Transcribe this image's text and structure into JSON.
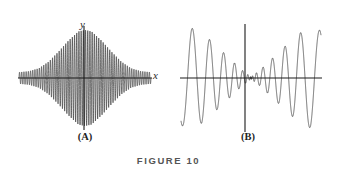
{
  "figure": {
    "caption": "FIGURE 10",
    "background_color": "#ffffff",
    "stroke_color": "#3a3a3a",
    "axis_color": "#1a1a1a"
  },
  "panels": [
    {
      "id": "A",
      "label": "(A)",
      "x_axis_label": "x",
      "y_axis_label": "y",
      "description": "amplitude-modulated oscillation with lens shaped envelope, maximum amplitude at the origin"
    },
    {
      "id": "B",
      "label": "(B)",
      "x_axis_label": "x",
      "y_axis_label": "y",
      "description": "oscillation pinched to near-zero amplitude at the origin and growing outward, bowtie shaped envelope near center"
    }
  ],
  "chart_data": [
    {
      "type": "line",
      "title": "(A)",
      "xlabel": "x",
      "ylabel": "y",
      "xlim": [
        -1,
        1
      ],
      "ylim": [
        -1.05,
        1.05
      ],
      "grid": false,
      "legend": null,
      "axes": {
        "x_axis_at_y": 0,
        "y_axis_at_x": 0,
        "arrows": false
      },
      "series": [
        {
          "name": "amplitude-modulated wave",
          "formula": "y = A(x) * sin(k(x) * x)",
          "envelope_description": "lens / diamond shaped, peak amplitude 1.0 at x = 0, decaying to about 0.12 at the plot edges",
          "envelope_x": [
            -1.0,
            -0.85,
            -0.7,
            -0.55,
            -0.4,
            -0.25,
            -0.1,
            0.0,
            0.1,
            0.25,
            0.4,
            0.55,
            0.7,
            0.85,
            1.0
          ],
          "envelope_y": [
            0.12,
            0.14,
            0.2,
            0.34,
            0.55,
            0.78,
            0.97,
            1.0,
            0.97,
            0.78,
            0.55,
            0.34,
            0.2,
            0.14,
            0.12
          ],
          "frequency_description": "high constant carrier frequency, roughly 60 oscillations across the plotted interval"
        }
      ]
    },
    {
      "type": "line",
      "title": "(B)",
      "xlabel": "x",
      "ylabel": "y",
      "xlim": [
        -1,
        1
      ],
      "ylim": [
        -1.05,
        1.05
      ],
      "grid": false,
      "legend": null,
      "axes": {
        "x_axis_at_y": 0,
        "y_axis_at_x": 0,
        "arrows": false
      },
      "series": [
        {
          "name": "chirp with vanishing center amplitude",
          "formula": "y = A(x) * sin(k(x) * x)",
          "envelope_description": "bowtie shape: amplitude near zero at x = 0, rising outward to about 1.0 near the edges",
          "envelope_x": [
            -1.0,
            -0.85,
            -0.7,
            -0.55,
            -0.4,
            -0.25,
            -0.12,
            0.0,
            0.12,
            0.25,
            0.4,
            0.55,
            0.7,
            0.85,
            1.0
          ],
          "envelope_y": [
            0.95,
            1.0,
            0.9,
            0.72,
            0.52,
            0.32,
            0.15,
            0.02,
            0.15,
            0.32,
            0.52,
            0.72,
            0.9,
            1.0,
            0.95
          ],
          "frequency_description": "frequency highest near the origin and decreasing outward; roughly 4 broad lobes on each side"
        }
      ]
    }
  ]
}
